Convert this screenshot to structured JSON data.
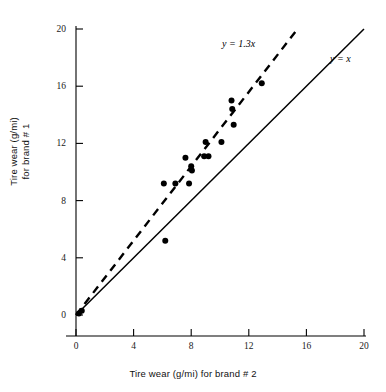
{
  "chart_data": {
    "type": "scatter",
    "title": "",
    "xlabel": "Tire wear (g/mi) for brand # 2",
    "ylabel_line1": "Tire wear (g/mi)",
    "ylabel_line2": "for brand # 1",
    "xlim": [
      0,
      20
    ],
    "ylim": [
      0,
      20
    ],
    "xticks": [
      0,
      4,
      8,
      12,
      16,
      20
    ],
    "yticks": [
      0,
      4,
      8,
      12,
      16,
      20
    ],
    "xticklabels": [
      "0",
      "4",
      "8",
      "12",
      "16",
      "20"
    ],
    "yticklabels": [
      "0",
      "4",
      "8",
      "12",
      "16",
      "20"
    ],
    "grid": false,
    "legend_position": "inline-annotation",
    "points": [
      {
        "x": 0.2,
        "y": 0.1
      },
      {
        "x": 0.4,
        "y": 0.3
      },
      {
        "x": 6.1,
        "y": 9.2
      },
      {
        "x": 6.2,
        "y": 5.2
      },
      {
        "x": 6.9,
        "y": 9.2
      },
      {
        "x": 7.6,
        "y": 11.0
      },
      {
        "x": 7.85,
        "y": 9.2
      },
      {
        "x": 8.0,
        "y": 10.4
      },
      {
        "x": 8.05,
        "y": 10.1
      },
      {
        "x": 8.9,
        "y": 11.1
      },
      {
        "x": 9.2,
        "y": 11.1
      },
      {
        "x": 9.0,
        "y": 12.1
      },
      {
        "x": 10.1,
        "y": 12.1
      },
      {
        "x": 10.8,
        "y": 15.0
      },
      {
        "x": 10.85,
        "y": 14.4
      },
      {
        "x": 10.95,
        "y": 13.3
      },
      {
        "x": 12.9,
        "y": 16.2
      }
    ],
    "lines": [
      {
        "name": "identity-line",
        "label": "y = x",
        "style": "solid",
        "slope": 1.0,
        "intercept": 0
      },
      {
        "name": "regression-line",
        "label": "y = 1.3x",
        "style": "dashed",
        "slope": 1.3,
        "intercept": 0
      }
    ],
    "annotations": [
      {
        "name": "dashed-line-label",
        "text": "y = 1.3x"
      },
      {
        "name": "solid-line-label",
        "text": "y = x"
      }
    ],
    "colors": {
      "axis": "#000000",
      "point": "#000000",
      "solid_line": "#000000",
      "dashed_line": "#000000",
      "background": "#ffffff"
    }
  }
}
